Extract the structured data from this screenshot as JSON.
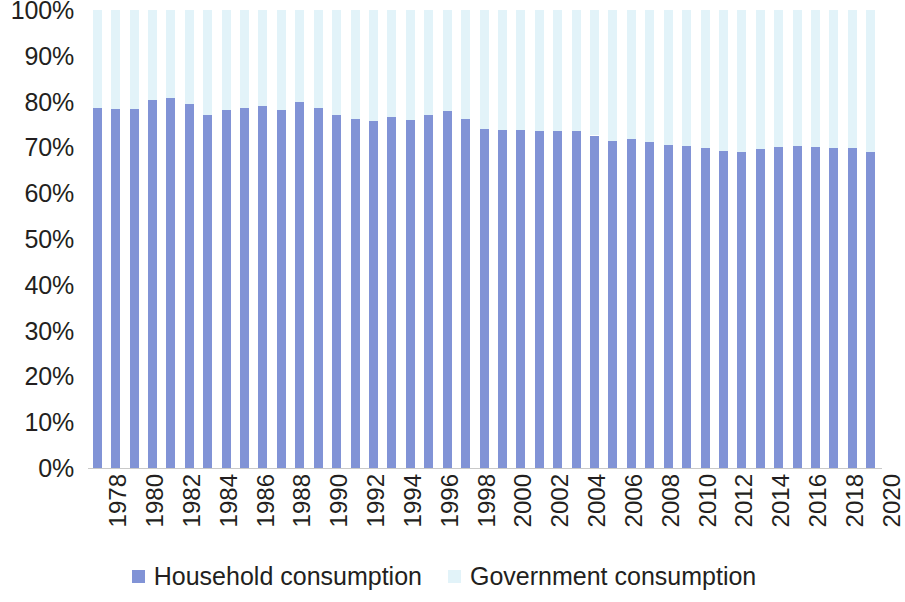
{
  "chart_data": {
    "type": "bar",
    "variant": "stacked-100-percent",
    "title": "",
    "xlabel": "",
    "ylabel": "",
    "ylim": [
      0,
      100
    ],
    "y_unit": "%",
    "grid": false,
    "legend_position": "bottom",
    "x": [
      1978,
      1979,
      1980,
      1981,
      1982,
      1983,
      1984,
      1985,
      1986,
      1987,
      1988,
      1989,
      1990,
      1991,
      1992,
      1993,
      1994,
      1995,
      1996,
      1997,
      1998,
      1999,
      2000,
      2001,
      2002,
      2003,
      2004,
      2005,
      2006,
      2007,
      2008,
      2009,
      2010,
      2011,
      2012,
      2013,
      2014,
      2015,
      2016,
      2017,
      2018,
      2019,
      2020
    ],
    "categories": [
      "1978",
      "1979",
      "1980",
      "1981",
      "1982",
      "1983",
      "1984",
      "1985",
      "1986",
      "1987",
      "1988",
      "1989",
      "1990",
      "1991",
      "1992",
      "1993",
      "1994",
      "1995",
      "1996",
      "1997",
      "1998",
      "1999",
      "2000",
      "2001",
      "2002",
      "2003",
      "2004",
      "2005",
      "2006",
      "2007",
      "2008",
      "2009",
      "2010",
      "2011",
      "2012",
      "2013",
      "2014",
      "2015",
      "2016",
      "2017",
      "2018",
      "2019",
      "2020"
    ],
    "tick_labels_x": [
      "1978",
      "1980",
      "1982",
      "1984",
      "1986",
      "1988",
      "1990",
      "1992",
      "1994",
      "1996",
      "1998",
      "2000",
      "2002",
      "2004",
      "2006",
      "2008",
      "2010",
      "2012",
      "2014",
      "2016",
      "2018",
      "2020"
    ],
    "tick_labels_y": [
      "0%",
      "10%",
      "20%",
      "30%",
      "40%",
      "50%",
      "60%",
      "70%",
      "80%",
      "90%",
      "100%"
    ],
    "tick_values_y": [
      0,
      10,
      20,
      30,
      40,
      50,
      60,
      70,
      80,
      90,
      100
    ],
    "series": [
      {
        "name": "Household consumption",
        "color": "#8193d6",
        "values": [
          78.6,
          78.3,
          78.4,
          80.4,
          80.8,
          79.4,
          77.0,
          78.2,
          78.5,
          79.1,
          78.2,
          80.0,
          78.6,
          77.0,
          76.2,
          75.8,
          76.6,
          75.9,
          77.1,
          78.0,
          76.3,
          74.0,
          73.8,
          73.9,
          73.5,
          73.6,
          73.6,
          72.6,
          71.5,
          71.9,
          71.2,
          70.6,
          70.3,
          69.8,
          69.3,
          69.1,
          69.6,
          70.0,
          70.2,
          70.1,
          69.9,
          69.9,
          69.1
        ]
      },
      {
        "name": "Government consumption",
        "color": "#e2f3f9",
        "values": [
          21.4,
          21.7,
          21.6,
          19.6,
          19.2,
          20.6,
          23.0,
          21.8,
          21.5,
          20.9,
          21.8,
          20.0,
          21.4,
          23.0,
          23.8,
          24.2,
          23.4,
          24.1,
          22.9,
          22.0,
          23.7,
          26.0,
          26.2,
          26.1,
          26.5,
          26.4,
          26.4,
          27.4,
          28.5,
          28.1,
          28.8,
          29.4,
          29.7,
          30.2,
          30.7,
          30.9,
          30.4,
          30.0,
          29.8,
          29.9,
          30.1,
          30.1,
          30.9
        ]
      }
    ]
  },
  "legend": {
    "items": [
      {
        "label": "Household consumption",
        "color": "#8193d6"
      },
      {
        "label": "Government consumption",
        "color": "#e2f3f9"
      }
    ]
  }
}
